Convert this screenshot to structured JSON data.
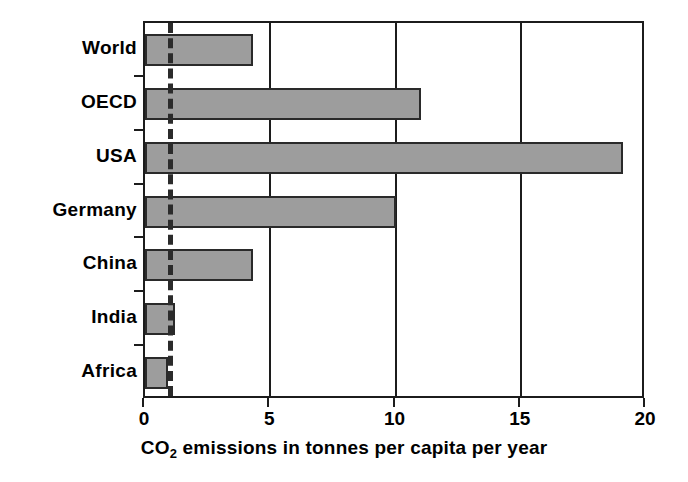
{
  "chart_data": {
    "type": "bar",
    "orientation": "horizontal",
    "title": "",
    "xlabel": "CO2 emissions in tonnes per capita per year",
    "xlabel_parts": {
      "pre": "CO",
      "sub": "2",
      "post": " emissions in tonnes per capita per year"
    },
    "ylabel": "",
    "categories": [
      "World",
      "OECD",
      "USA",
      "Germany",
      "China",
      "India",
      "Africa"
    ],
    "values": [
      4.3,
      11.0,
      19.1,
      10.0,
      4.3,
      1.2,
      0.9
    ],
    "xlim": [
      0,
      20
    ],
    "xticks": [
      0,
      5,
      10,
      15,
      20
    ],
    "xtick_labels": [
      "0",
      "5",
      "10",
      "15",
      "20"
    ],
    "gridlines_x": [
      5,
      10,
      15
    ],
    "grid": true,
    "legend": "none",
    "annotations": [
      {
        "name": "sustainable-threshold",
        "type": "vertical-dashed-line",
        "value": 1.0,
        "label": ""
      }
    ],
    "colors": {
      "bar_fill": "#9d9d9d",
      "bar_border": "#2a2a2a",
      "axis": "#1c1c1c",
      "gridline": "#1c1c1c",
      "threshold": "#2b2b2b",
      "background": "#ffffff",
      "text": "#000000"
    }
  }
}
